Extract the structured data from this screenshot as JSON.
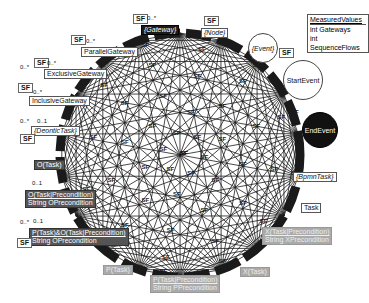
{
  "legend": {
    "title": "MeasuredValues",
    "rows": [
      "int  Gateways",
      "int  SequenceFlows"
    ]
  },
  "edge_label": "SF",
  "multiplicities": {
    "many": "0..*",
    "optional": "0..1"
  },
  "nodes": {
    "gateway": {
      "label": "{Gateway}"
    },
    "node": {
      "label": "{Node}"
    },
    "parallel_gateway": {
      "label": "ParallelGateway"
    },
    "exclusive_gateway": {
      "label": "ExclusiveGateway"
    },
    "inclusive_gateway": {
      "label": "InclusiveGateway"
    },
    "deontic_task": {
      "label": "{DeonticTask}"
    },
    "o_task": {
      "label": "O(Task)"
    },
    "o_task_precondition": {
      "label": "O(Task|Precondition)",
      "attr": "String  OPrecondition"
    },
    "p_and_o_task_precondition": {
      "label": "P(Task)&O(Task|Precondition)",
      "attr": "String  OPrecondition"
    },
    "p_task": {
      "label": "P(Task)"
    },
    "p_task_precondition": {
      "label": "P(Task|Precondition)",
      "attr": "String  PPrecondition"
    },
    "x_task": {
      "label": "X(Task)"
    },
    "x_task_precondition": {
      "label": "X(Task|Precondition)",
      "attr": "String  XPrecondition"
    },
    "task": {
      "label": "Task"
    },
    "bpmn_task": {
      "label": "{BpmnTask}"
    },
    "event": {
      "label": "{Event}"
    },
    "start_event": {
      "label": "StartEvent"
    },
    "end_event": {
      "label": "EndEvent"
    }
  },
  "colors": {
    "edge": "#1a1a1a",
    "dark_node": "#1a1a1a",
    "mid_node": "#555555",
    "light_node": "#aaaaaa",
    "background": "#ffffff"
  }
}
